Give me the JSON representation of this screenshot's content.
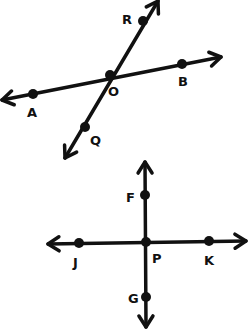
{
  "diagram": {
    "stroke_color": "#111111",
    "background": "#ffffff",
    "figures": [
      {
        "name": "intersecting-lines",
        "lines": [
          {
            "name": "line-AB",
            "from": [
              2,
              100
            ],
            "to": [
              221,
              57
            ],
            "through": [
              "A",
              "O",
              "B"
            ]
          },
          {
            "name": "line-QR",
            "from": [
              65,
              158
            ],
            "to": [
              158,
              1
            ],
            "through": [
              "Q",
              "O",
              "R"
            ]
          }
        ],
        "points": [
          {
            "label": "R",
            "x": 143,
            "y": 21,
            "lx": 122,
            "ly": 24
          },
          {
            "label": "O",
            "x": 110,
            "y": 75,
            "lx": 108,
            "ly": 96
          },
          {
            "label": "B",
            "x": 182,
            "y": 64,
            "lx": 178,
            "ly": 86
          },
          {
            "label": "A",
            "x": 33,
            "y": 94,
            "lx": 27,
            "ly": 117
          },
          {
            "label": "Q",
            "x": 85,
            "y": 127,
            "lx": 90,
            "ly": 145
          }
        ]
      },
      {
        "name": "perpendicular-lines",
        "lines": [
          {
            "name": "line-JK",
            "from": [
              48,
              244
            ],
            "to": [
              246,
              241
            ],
            "through": [
              "J",
              "P",
              "K"
            ]
          },
          {
            "name": "line-FG",
            "from": [
              145,
              162
            ],
            "to": [
              146,
              327
            ],
            "through": [
              "F",
              "P",
              "G"
            ]
          }
        ],
        "points": [
          {
            "label": "F",
            "x": 145,
            "y": 195,
            "lx": 126,
            "ly": 202
          },
          {
            "label": "P",
            "x": 146,
            "y": 242,
            "lx": 152,
            "ly": 263
          },
          {
            "label": "J",
            "x": 79,
            "y": 243,
            "lx": 73,
            "ly": 267
          },
          {
            "label": "K",
            "x": 209,
            "y": 241,
            "lx": 204,
            "ly": 265
          },
          {
            "label": "G",
            "x": 146,
            "y": 297,
            "lx": 128,
            "ly": 303
          }
        ]
      }
    ]
  }
}
